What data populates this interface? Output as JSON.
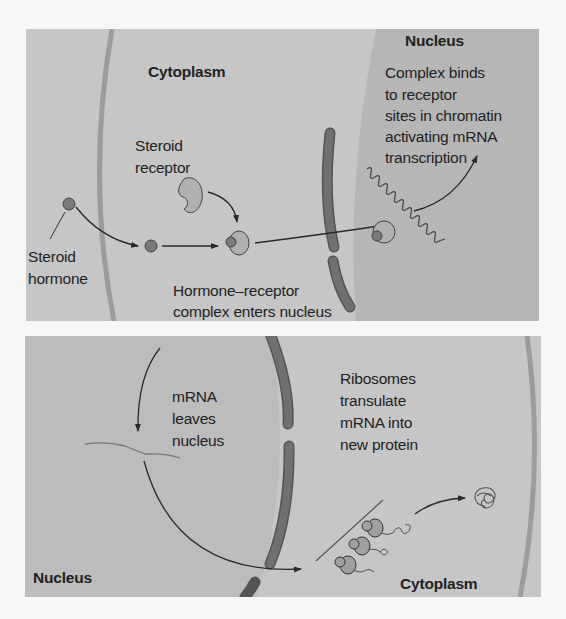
{
  "figure": {
    "colors": {
      "cytoplasm_bg": "#c6c6c6",
      "nucleus_bg": "#b4b4b4",
      "membrane": "#9a9a9a",
      "nuclear_envelope": "#6b6b6b",
      "hormone": "#7a7a7a",
      "receptor": "#b0b0b0",
      "arrow": "#2a2a2a",
      "text": "#222222"
    }
  },
  "top_panel": {
    "labels": {
      "cytoplasm": "Cytoplasm",
      "nucleus": "Nucleus",
      "steroid_receptor_1": "Steroid",
      "steroid_receptor_2": "receptor",
      "steroid_hormone_1": "Steroid",
      "steroid_hormone_2": "hormone",
      "complex_enters_1": "Hormone–receptor",
      "complex_enters_2": "complex enters nucleus",
      "complex_binds_1": "Complex binds",
      "complex_binds_2": "to receptor",
      "complex_binds_3": "sites in chromatin",
      "complex_binds_4": "activating mRNA",
      "complex_binds_5": "transcription"
    }
  },
  "bottom_panel": {
    "labels": {
      "mrna_leaves_1": "mRNA",
      "mrna_leaves_2": "leaves",
      "mrna_leaves_3": "nucleus",
      "ribosomes_1": "Ribosomes",
      "ribosomes_2": "transulate",
      "ribosomes_3": "mRNA into",
      "ribosomes_4": "new protein",
      "nucleus": "Nucleus",
      "cytoplasm": "Cytoplasm"
    }
  }
}
